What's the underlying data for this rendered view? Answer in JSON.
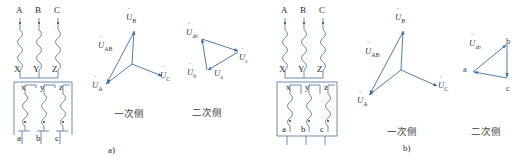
{
  "figure": {
    "subfigure_a_label": "a)",
    "subfigure_b_label": "b)",
    "primary_side_label": "一次侧",
    "secondary_side_label": "二次侧",
    "line_color": "#5a7fa8",
    "text_color": "#2a2a2a",
    "phasor_color": "#3b6ea5"
  },
  "subfigure_a": {
    "circuit": {
      "primary_terminals_top": [
        "A",
        "B",
        "C"
      ],
      "primary_terminals_bottom": [
        "X",
        "Y",
        "Z"
      ],
      "secondary_terminals_top": [
        "x",
        "y",
        "z"
      ],
      "secondary_terminals_bottom": [
        "a",
        "b",
        "c"
      ],
      "polarity_marker": "•"
    },
    "primary_phasor": {
      "title": "一次侧",
      "vectors": [
        {
          "name": "U_B",
          "base": "U",
          "sub": "B",
          "dot": true
        },
        {
          "name": "U_A",
          "base": "U",
          "sub": "A",
          "dot": true
        },
        {
          "name": "U_C",
          "base": "U",
          "sub": "C",
          "dot": true
        },
        {
          "name": "U_AB",
          "base": "U",
          "sub": "AB",
          "dot": true
        }
      ]
    },
    "secondary_phasor": {
      "title": "二次侧",
      "vectors": [
        {
          "name": "U_ab",
          "base": "U",
          "sub": "ab",
          "dot": true
        },
        {
          "name": "U_b",
          "base": "U",
          "sub": "b",
          "dot": true
        },
        {
          "name": "U_a",
          "base": "U",
          "sub": "a",
          "dot": true
        },
        {
          "name": "U_c",
          "base": "U",
          "sub": "c",
          "dot": true
        }
      ]
    }
  },
  "subfigure_b": {
    "circuit": {
      "primary_terminals_top": [
        "A",
        "B",
        "C"
      ],
      "primary_terminals_bottom": [
        "X",
        "Y",
        "Z"
      ],
      "secondary_terminals_top": [
        "x",
        "y",
        "z"
      ],
      "secondary_terminals_bottom": [
        "a",
        "b",
        "c"
      ],
      "polarity_marker": "•"
    },
    "primary_phasor": {
      "title": "一次侧",
      "vectors": [
        {
          "name": "U_B",
          "base": "U",
          "sub": "B",
          "dot": true
        },
        {
          "name": "U_A",
          "base": "U",
          "sub": "A",
          "dot": true
        },
        {
          "name": "U_C",
          "base": "U",
          "sub": "C",
          "dot": true
        },
        {
          "name": "U_AB",
          "base": "U",
          "sub": "AB",
          "dot": true
        }
      ]
    },
    "secondary_phasor": {
      "title": "二次侧",
      "vertex_labels": [
        "a",
        "b",
        "c"
      ],
      "vectors": [
        {
          "name": "U_ab",
          "base": "U",
          "sub": "ab",
          "dot": true
        }
      ]
    }
  }
}
